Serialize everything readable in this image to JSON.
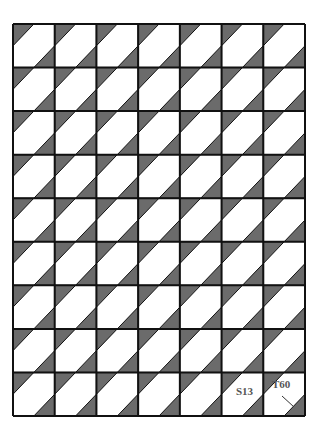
{
  "diagram": {
    "type": "quilt-block-grid",
    "grid": {
      "columns": 7,
      "rows": 9,
      "left": 13,
      "top": 24,
      "right": 305,
      "bottom": 416
    },
    "colors": {
      "background": "#ffffff",
      "dark": "#6b6b6b",
      "light": "#ffffff",
      "line": "#111111"
    },
    "labels": [
      {
        "text": "S13",
        "x": 236,
        "y": 385
      },
      {
        "text": "T60",
        "x": 272,
        "y": 378
      }
    ],
    "leader": {
      "x1": 282,
      "y1": 396,
      "x2": 294,
      "y2": 407
    }
  }
}
